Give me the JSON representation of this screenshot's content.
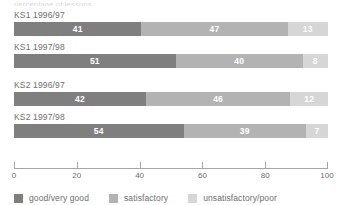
{
  "top_clip_text": "percentage of lessons",
  "chart_data": {
    "type": "bar",
    "subtype": "stacked-horizontal-100",
    "title": "",
    "xlabel": "",
    "ylabel": "",
    "xlim": [
      0,
      100
    ],
    "grid": false,
    "legend_position": "bottom-left",
    "categories": [
      "KS1 1996/97",
      "KS1 1997/98",
      "KS2 1996/97",
      "KS2 1997/98"
    ],
    "series": [
      {
        "name": "good/very good",
        "color": "#7f7f7f",
        "values": [
          41,
          51,
          42,
          54
        ]
      },
      {
        "name": "satisfactory",
        "color": "#b3b3b3",
        "values": [
          47,
          40,
          46,
          39
        ]
      },
      {
        "name": "unsatisfactory/poor",
        "color": "#d6d6d6",
        "values": [
          13,
          8,
          12,
          7
        ]
      }
    ],
    "xticks": [
      0,
      20,
      40,
      60,
      80,
      100
    ],
    "xtick_labels": [
      "0",
      "20",
      "40",
      "60",
      "80",
      "100"
    ]
  },
  "axis": {
    "color": "#a6a6a6"
  },
  "text_color": "#6e6e6e",
  "value_label_color": "#ffffff"
}
